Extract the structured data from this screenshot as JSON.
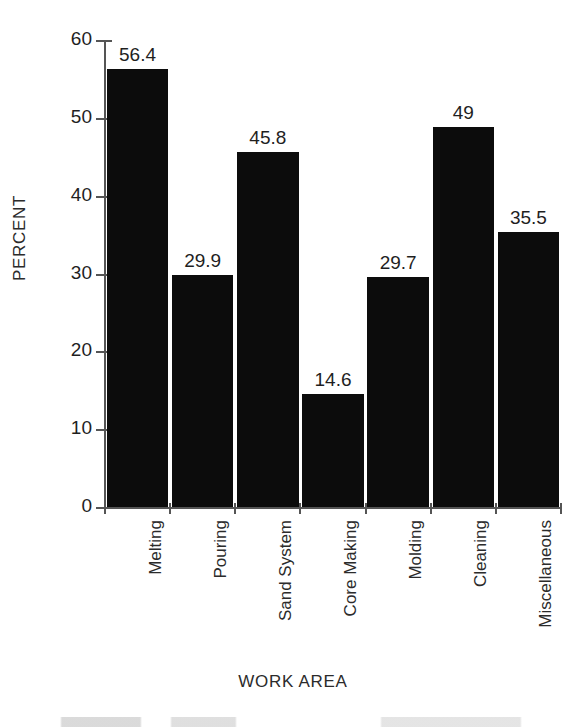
{
  "chart_data": {
    "type": "bar",
    "title": "",
    "xlabel": "WORK AREA",
    "ylabel": "PERCENT",
    "categories": [
      "Melting",
      "Pouring",
      "Sand System",
      "Core Making",
      "Molding",
      "Cleaning",
      "Miscellaneous"
    ],
    "values": [
      56.4,
      29.9,
      45.8,
      14.6,
      29.7,
      49,
      35.5
    ],
    "value_labels": [
      "56.4",
      "29.9",
      "45.8",
      "14.6",
      "29.7",
      "49",
      "35.5"
    ],
    "ylim": [
      0,
      60
    ],
    "y_ticks": [
      0,
      10,
      20,
      30,
      40,
      50,
      60
    ],
    "y_tick_labels": [
      "0",
      "10",
      "20",
      "30",
      "40",
      "50",
      "60"
    ],
    "grid": false,
    "legend": null,
    "bar_color": "#0c0c0c",
    "axis_color": "#555555",
    "background_color": "#ffffff"
  }
}
